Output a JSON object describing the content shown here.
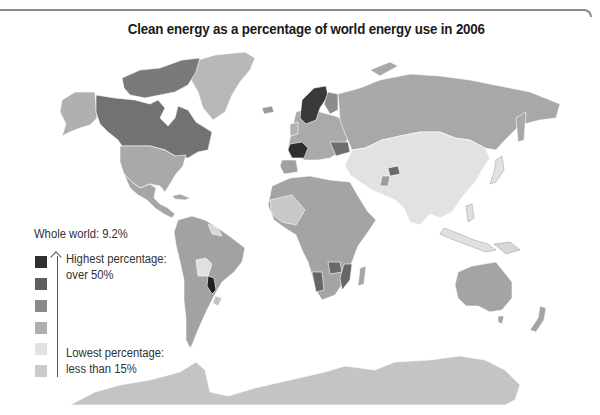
{
  "title": "Clean energy as a percentage of world energy use in 2006",
  "legend": {
    "whole_world": "Whole world: 9.2%",
    "highest_line1": "Highest percentage:",
    "highest_line2": "over 50%",
    "lowest_line1": "Lowest percentage:",
    "lowest_line2": "less than 15%",
    "swatches": [
      {
        "level": 1,
        "color": "#2f2f2f"
      },
      {
        "level": 2,
        "color": "#5e5e5e"
      },
      {
        "level": 3,
        "color": "#8a8a8a"
      },
      {
        "level": 4,
        "color": "#b0b0b0"
      },
      {
        "level": 5,
        "color": "#e2e2e2"
      },
      {
        "level": 6,
        "color": "#cbcbcb"
      }
    ],
    "arrow_direction": "up"
  },
  "map": {
    "type": "choropleth",
    "colors": {
      "darkest": "#2f2f2f",
      "dark": "#5e5e5e",
      "mid": "#8a8a8a",
      "midlight": "#a8a8a8",
      "light": "#b5b5b5",
      "lightest": "#e2e2e2",
      "low": "#c4c4c4",
      "border": "#ffffff"
    },
    "regions_highlighted": [
      {
        "region": "Norway / Sweden",
        "shade": "darkest"
      },
      {
        "region": "France",
        "shade": "darkest"
      },
      {
        "region": "Paraguay",
        "shade": "darkest"
      },
      {
        "region": "Canada",
        "shade": "dark"
      },
      {
        "region": "Namibia / Zambia / Mozambique",
        "shade": "dark"
      },
      {
        "region": "Russia",
        "shade": "midlight"
      },
      {
        "region": "China / South Asia",
        "shade": "lightest"
      },
      {
        "region": "Bolivia",
        "shade": "lightest"
      }
    ]
  }
}
